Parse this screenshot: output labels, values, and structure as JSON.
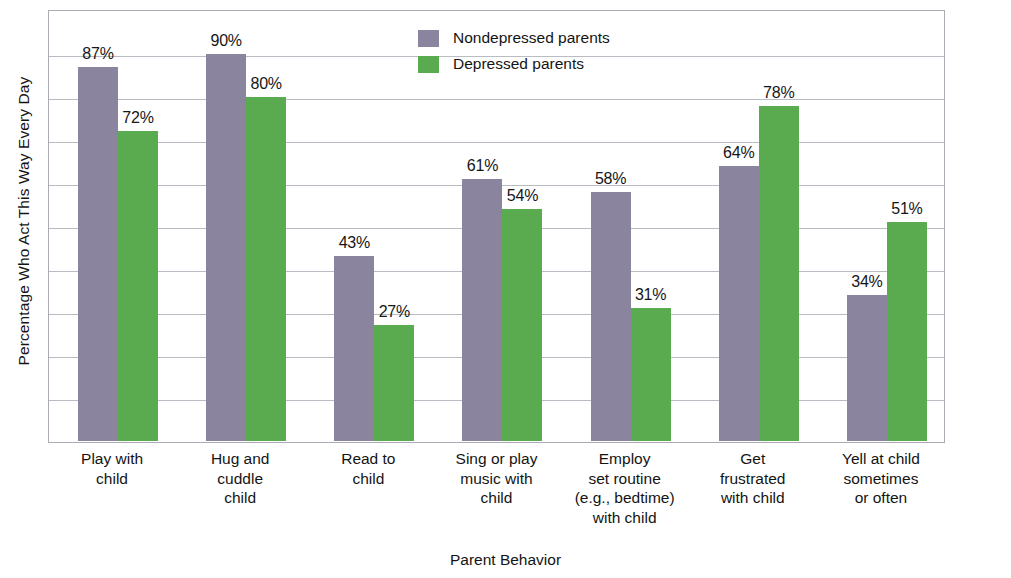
{
  "chart_data": {
    "type": "bar",
    "title": "",
    "xlabel": "Parent Behavior",
    "ylabel": "Percentage Who Act This Way Every Day",
    "ylim": [
      0,
      100
    ],
    "grid": true,
    "grid_step": 10,
    "legend_position": "top-right inside plot area",
    "value_suffix": "%",
    "categories": [
      "Play with\nchild",
      "Hug and\ncuddle\nchild",
      "Read to\nchild",
      "Sing or play\nmusic with\nchild",
      "Employ\nset routine\n(e.g., bedtime)\nwith child",
      "Get\nfrustrated\nwith child",
      "Yell at child\nsometimes\nor often"
    ],
    "series": [
      {
        "name": "Nondepressed parents",
        "color": "#8a849e",
        "values": [
          87,
          90,
          43,
          61,
          58,
          64,
          34
        ],
        "labels": [
          "87%",
          "90%",
          "43%",
          "61%",
          "58%",
          "64%",
          "34%"
        ]
      },
      {
        "name": "Depressed parents",
        "color": "#5aab4f",
        "values": [
          72,
          80,
          27,
          54,
          31,
          78,
          51
        ],
        "labels": [
          "72%",
          "80%",
          "27%",
          "54%",
          "31%",
          "78%",
          "51%"
        ]
      }
    ]
  },
  "legend": {
    "items": [
      {
        "label": "Nondepressed parents",
        "color": "#8a849e"
      },
      {
        "label": "Depressed parents",
        "color": "#5aab4f"
      }
    ]
  },
  "axes": {
    "y_title": "Percentage Who Act This Way Every Day",
    "x_title": "Parent Behavior"
  },
  "colors": {
    "nondepressed": "#8a849e",
    "depressed": "#5aab4f",
    "gridline": "#b9bcc2",
    "frame": "#a9acb2",
    "text": "#141414",
    "background": "#ffffff"
  }
}
